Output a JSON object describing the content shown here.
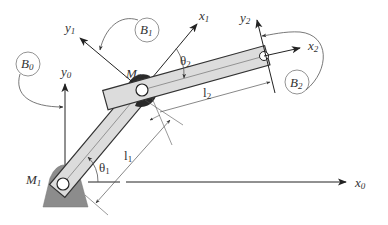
{
  "diagram": {
    "colors": {
      "background": "#ffffff",
      "link_fill": "#dcdcdc",
      "link_stroke": "#333333",
      "base_fill": "#8c8c8c",
      "motor_fill": "#2a2a2a",
      "axis": "#222222",
      "thin_line": "#555555"
    },
    "frames": [
      {
        "id": "B0",
        "label": "B",
        "sub": "0"
      },
      {
        "id": "B1",
        "label": "B",
        "sub": "1"
      },
      {
        "id": "B2",
        "label": "B",
        "sub": "2"
      }
    ],
    "axes": [
      {
        "id": "x0",
        "label": "x",
        "sub": "0"
      },
      {
        "id": "y0",
        "label": "y",
        "sub": "0"
      },
      {
        "id": "x1",
        "label": "x",
        "sub": "1"
      },
      {
        "id": "y1",
        "label": "y",
        "sub": "1"
      },
      {
        "id": "x2",
        "label": "x",
        "sub": "2"
      },
      {
        "id": "y2",
        "label": "y",
        "sub": "2"
      }
    ],
    "motors": [
      {
        "id": "M1",
        "label": "M",
        "sub": "1"
      },
      {
        "id": "M2",
        "label": "M",
        "sub": "2"
      }
    ],
    "angles": [
      {
        "id": "theta1",
        "label": "θ",
        "sub": "1"
      },
      {
        "id": "theta2",
        "label": "θ",
        "sub": "2"
      }
    ],
    "lengths": [
      {
        "id": "l1",
        "label": "l",
        "sub": "1"
      },
      {
        "id": "l2",
        "label": "l",
        "sub": "2"
      }
    ]
  }
}
